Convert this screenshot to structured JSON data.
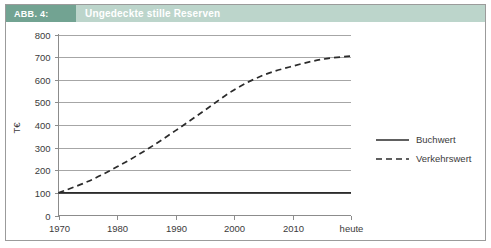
{
  "figure": {
    "caption_number": "ABB. 4:",
    "caption_title": "Ungedeckte stille Reserven",
    "accent_dark": "#72a392",
    "accent_light": "#bcd5cb",
    "frame_color": "#9b9b9b"
  },
  "chart_data": {
    "type": "line",
    "title": "Ungedeckte stille Reserven",
    "xlabel": "",
    "ylabel": "T€",
    "x": [
      1970,
      1980,
      1990,
      2000,
      2010,
      2020
    ],
    "categories": [
      "1970",
      "1980",
      "1990",
      "2000",
      "2010",
      "heute"
    ],
    "xtick_labels": [
      "1970",
      "1980",
      "1990",
      "2000",
      "2010",
      "heute"
    ],
    "ytick_labels": [
      "0",
      "100",
      "200",
      "300",
      "400",
      "500",
      "600",
      "700",
      "800"
    ],
    "yticks": [
      0,
      100,
      200,
      300,
      400,
      500,
      600,
      700,
      800
    ],
    "ylim": [
      0,
      800
    ],
    "grid": "horizontal",
    "legend_position": "right",
    "series": [
      {
        "name": "Buchwert",
        "style": "solid",
        "color": "#2b2b2b",
        "values": [
          100,
          100,
          100,
          100,
          100,
          100
        ]
      },
      {
        "name": "Verkehrswert",
        "style": "dashed",
        "color": "#2b2b2b",
        "values": [
          100,
          215,
          375,
          555,
          660,
          705
        ],
        "detail_x": [
          1970,
          1975,
          1980,
          1985,
          1990,
          1995,
          2000,
          2005,
          2010,
          2015,
          2020
        ],
        "detail_values": [
          100,
          150,
          215,
          290,
          375,
          465,
          555,
          620,
          660,
          690,
          705
        ]
      }
    ]
  },
  "legend": {
    "items": [
      {
        "label": "Buchwert",
        "style": "solid"
      },
      {
        "label": "Verkehrswert",
        "style": "dashed"
      }
    ]
  }
}
